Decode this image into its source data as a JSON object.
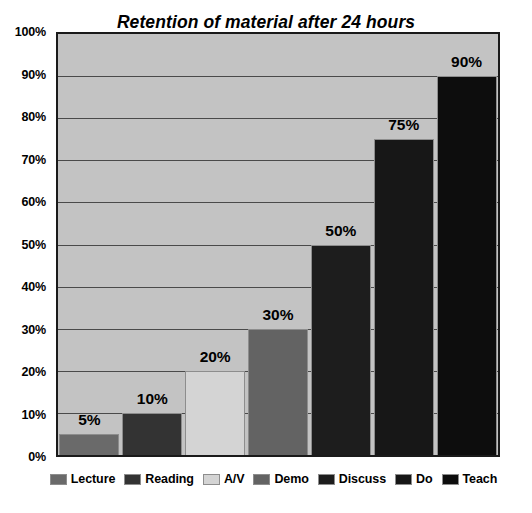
{
  "chart_data": {
    "type": "bar",
    "title": "Retention of material after 24 hours",
    "xlabel": "",
    "ylabel": "",
    "ylim": [
      0,
      100
    ],
    "grid": true,
    "legend_position": "bottom",
    "categories": [
      "Lecture",
      "Reading",
      "A/V",
      "Demo",
      "Discuss",
      "Do",
      "Teach"
    ],
    "values": [
      5,
      10,
      20,
      30,
      50,
      75,
      90
    ],
    "value_labels": [
      "5%",
      "10%",
      "20%",
      "30%",
      "50%",
      "75%",
      "90%"
    ],
    "y_ticks": [
      0,
      10,
      20,
      30,
      40,
      50,
      60,
      70,
      80,
      90,
      100
    ],
    "y_tick_labels": [
      "0%",
      "10%",
      "20%",
      "30%",
      "40%",
      "50%",
      "60%",
      "70%",
      "80%",
      "90%",
      "100%"
    ],
    "series_colors": [
      "#6a6a6a",
      "#333333",
      "#d4d4d4",
      "#636363",
      "#1d1d1d",
      "#171717",
      "#0d0d0d"
    ],
    "plot_background": "#c3c3c3",
    "gridline_color": "#4a4a4a",
    "axis_color": "#1a1a1a",
    "page_background": "#ffffff"
  },
  "legend": {
    "items": [
      {
        "label": "Lecture",
        "color": "#6a6a6a"
      },
      {
        "label": "Reading",
        "color": "#333333"
      },
      {
        "label": "A/V",
        "color": "#d4d4d4"
      },
      {
        "label": "Demo",
        "color": "#636363"
      },
      {
        "label": "Discuss",
        "color": "#1d1d1d"
      },
      {
        "label": "Do",
        "color": "#171717"
      },
      {
        "label": "Teach",
        "color": "#0d0d0d"
      }
    ]
  }
}
